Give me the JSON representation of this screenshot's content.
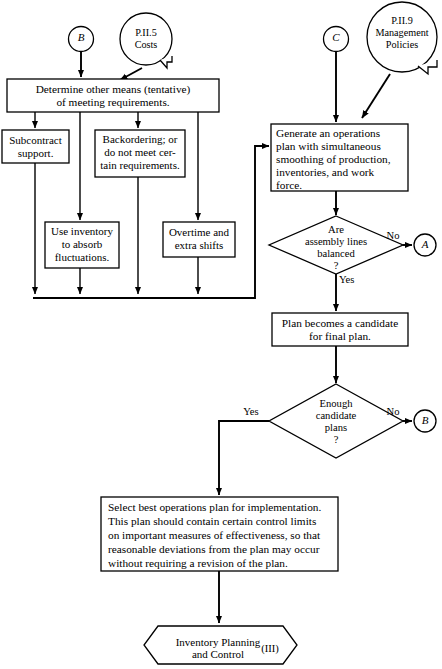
{
  "diagram": {
    "type": "flowchart"
  },
  "connectors": {
    "b_top": "B",
    "c_top": "C",
    "a_right": "A",
    "b_right": "B"
  },
  "documents": {
    "costs": {
      "line1": "P.II.5",
      "line2": "Costs"
    },
    "policies": {
      "line1": "P.II.9",
      "line2": "Management",
      "line3": "Policies"
    }
  },
  "boxes": {
    "determine": {
      "line1": "Determine other means (tentative)",
      "line2": "of meeting requirements."
    },
    "subcontract": {
      "line1": "Subcontract",
      "line2": "support."
    },
    "backordering": {
      "line1": "Backordering; or",
      "line2": "do not meet cer-",
      "line3": "tain requirements."
    },
    "use_inventory": {
      "line1": "Use inventory",
      "line2": "to absorb",
      "line3": "fluctuations."
    },
    "overtime": {
      "line1": "Overtime and",
      "line2": "extra shifts"
    },
    "generate": {
      "line1": "Generate an operations",
      "line2": "plan with simultaneous",
      "line3": "smoothing of production,",
      "line4": "inventories, and work",
      "line5": "force."
    },
    "candidate": {
      "line1": "Plan becomes a candidate",
      "line2": "for final plan."
    },
    "select_best": {
      "line1": "Select best operations plan for implementation.",
      "line2": "This plan should contain certain control limits",
      "line3": "on important measures of effectiveness, so that",
      "line4": "reasonable deviations from the plan may occur",
      "line5": "without requiring a revision of the plan."
    }
  },
  "decisions": {
    "assembly": {
      "line1": "Are",
      "line2": "assembly lines",
      "line3": "balanced",
      "line4": "?",
      "yes_label": "Yes",
      "no_label": "No"
    },
    "enough": {
      "line1": "Enough",
      "line2": "candidate",
      "line3": "plans",
      "line4": "?",
      "yes_label": "Yes",
      "no_label": "No"
    }
  },
  "terminator": {
    "line1": "Inventory Planning",
    "line2": "and Control",
    "number": "(III)"
  },
  "colors": {
    "stroke": "#000000",
    "fill": "#ffffff",
    "background": "#ffffff"
  }
}
